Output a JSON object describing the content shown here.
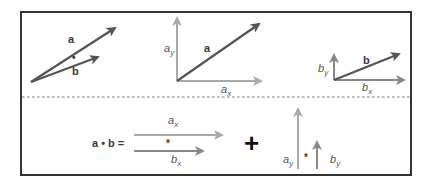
{
  "diagram": {
    "colors": {
      "frame": "#333333",
      "dashed_divider": "#777777",
      "main_vector": "#555555",
      "component_vector_light": "#aaaaaa",
      "component_vector_mid": "#888888",
      "plus": "#111111"
    },
    "top_row": {
      "panel1": {
        "vector_a_label": "a",
        "vector_b_label": "b",
        "operator": "•"
      },
      "panel2": {
        "vector_label": "a",
        "y_component": {
          "base": "a",
          "sub": "y"
        },
        "x_component": {
          "base": "a",
          "sub": "x"
        }
      },
      "panel3": {
        "vector_label": "b",
        "y_component": {
          "base": "b",
          "sub": "y"
        },
        "x_component": {
          "base": "b",
          "sub": "x"
        }
      }
    },
    "bottom_row": {
      "equation_lhs": "a • b =",
      "x_term": {
        "top": {
          "base": "a",
          "sub": "x"
        },
        "operator": "*",
        "bottom": {
          "base": "b",
          "sub": "x"
        }
      },
      "plus": "+",
      "y_term": {
        "left": {
          "base": "a",
          "sub": "y"
        },
        "operator": "*",
        "right": {
          "base": "b",
          "sub": "y"
        }
      }
    }
  }
}
